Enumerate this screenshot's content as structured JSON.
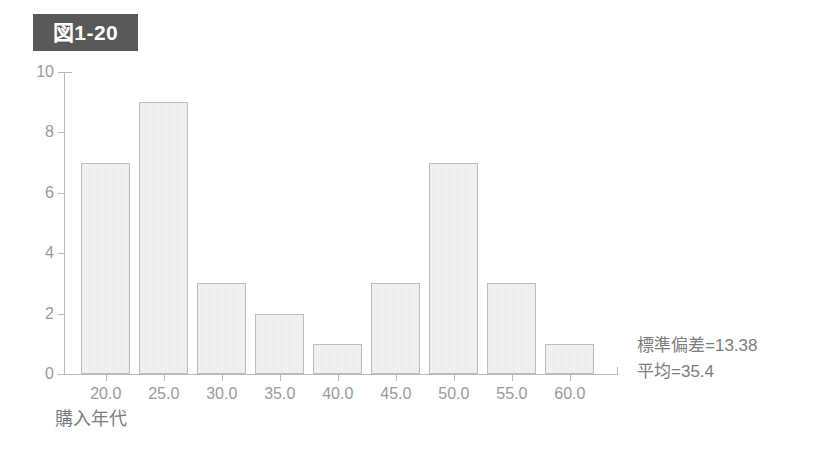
{
  "figure": {
    "badge_label": "図1-20",
    "badge_color": "#595959",
    "badge_text_color": "#ffffff"
  },
  "annotations": {
    "std_dev": "標準偏差=13.38",
    "mean": "平均=35.4"
  },
  "chart_data": {
    "type": "bar",
    "title": "図1-20",
    "xlabel": "購入年代",
    "ylabel": "",
    "categories": [
      "20.0",
      "25.0",
      "30.0",
      "35.0",
      "40.0",
      "45.0",
      "50.0",
      "55.0",
      "60.0"
    ],
    "values": [
      7,
      9,
      3,
      2,
      1,
      3,
      7,
      3,
      1
    ],
    "ylim": [
      0,
      10
    ],
    "yticks": [
      "0",
      "2",
      "4",
      "6",
      "8",
      "10"
    ],
    "ytick_values": [
      0,
      2,
      4,
      6,
      8,
      10
    ],
    "grid": false,
    "legend": false,
    "bar_fill_color": "#efefef",
    "bar_border_color": "#bdbdbd",
    "axis_color": "#b9b9b9",
    "statistics": {
      "standard_deviation": 13.38,
      "mean": 35.4
    }
  }
}
